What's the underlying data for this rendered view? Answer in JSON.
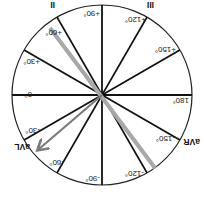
{
  "diagram": {
    "orientation": "rotated 180 degrees",
    "center": [
      102,
      105
    ],
    "radius": 90,
    "colors": {
      "circle": "#222222",
      "axes": "#111111",
      "lead_ii_axis": "#a8a8a8",
      "vector_arrow": "#7a7a7a",
      "text": "#222222"
    },
    "degree_labels": [
      {
        "id": "deg-0",
        "text": "0°",
        "angle": 0
      },
      {
        "id": "deg-p30",
        "text": "+30°",
        "angle": 30
      },
      {
        "id": "deg-p60",
        "text": "+60°",
        "angle": 60
      },
      {
        "id": "deg-p90",
        "text": "+90°",
        "angle": 90
      },
      {
        "id": "deg-p120",
        "text": "+120°",
        "angle": 120
      },
      {
        "id": "deg-p150",
        "text": "+150°",
        "angle": 150
      },
      {
        "id": "deg-180",
        "text": "180°",
        "angle": 180
      },
      {
        "id": "deg-m150",
        "text": "-150°",
        "angle": -150
      },
      {
        "id": "deg-m120",
        "text": "-120°",
        "angle": -120
      },
      {
        "id": "deg-m90",
        "text": "-90°",
        "angle": -90
      },
      {
        "id": "deg-m60",
        "text": "-60°",
        "angle": -60
      },
      {
        "id": "deg-m30",
        "text": "-30°",
        "angle": -30
      }
    ],
    "lead_labels": {
      "ii": "II",
      "iii": "III",
      "avl": "aVL",
      "avr": "aVR"
    },
    "highlighted_axis": {
      "lead": "II",
      "angle": 60
    },
    "vector_arrow": {
      "lead": "aVL",
      "angle": -30
    }
  }
}
